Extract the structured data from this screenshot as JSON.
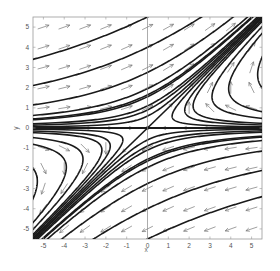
{
  "chart_data": {
    "type": "line",
    "subtype": "phase-portrait",
    "title": "",
    "xlabel": "x",
    "ylabel": "y",
    "xlim": [
      -5.5,
      5.5
    ],
    "ylim": [
      -5.5,
      5.5
    ],
    "xticks": [
      -5,
      -4,
      -3,
      -2,
      -1,
      0,
      1,
      2,
      3,
      4,
      5
    ],
    "yticks": [
      -5,
      -4,
      -3,
      -2,
      -1,
      0,
      1,
      2,
      3,
      4,
      5
    ],
    "grid": false,
    "legend": null,
    "system": {
      "dx_dt": "-x + 2y",
      "dy_dt": "y"
    },
    "equilibrium": {
      "x": 0,
      "y": 0,
      "type": "saddle"
    },
    "manifolds": [
      {
        "name": "stable",
        "equation": "y = 0"
      },
      {
        "name": "unstable",
        "equation": "y = x"
      }
    ],
    "trajectory_invariant": "y*(x - y) = K",
    "trajectory_K_values": [
      -30.3,
      -16.0,
      -7.6,
      -2.7,
      -0.8,
      0.35,
      1.2,
      2.4,
      3.8,
      7.0,
      12.0,
      18.0,
      26.0,
      -0.35,
      0.8,
      -1.2,
      -2.4,
      -3.8
    ],
    "quiver": {
      "x": [
        -5,
        -4,
        -3,
        -2,
        -1,
        0,
        1,
        2,
        3,
        4,
        5
      ],
      "y": [
        -5,
        -4,
        -3,
        -2,
        -1,
        0,
        1,
        2,
        3,
        4,
        5
      ],
      "style": "normalized arrows, gray"
    },
    "colors": {
      "trajectory": "#1a1a1a",
      "arrow": "#777777",
      "axis": "#888888",
      "frame": "#999999"
    }
  }
}
